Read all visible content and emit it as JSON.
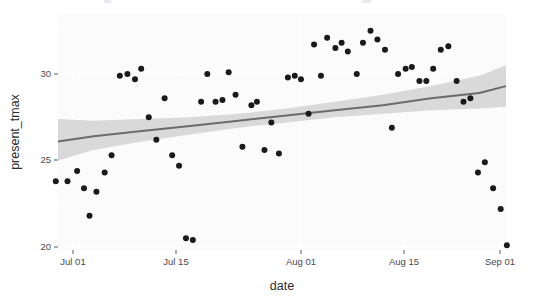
{
  "figure": {
    "background_color": "#ffffff",
    "panel_color": "#fbfbfb",
    "grid_color": "#ffffff",
    "point_color": "#1a1a1a",
    "line_color": "#6b6b6b",
    "ribbon_color": "#d6d6d6"
  },
  "axes": {
    "x_title": "date",
    "y_title": "present_tmax",
    "x_ticks": [
      {
        "label": "Jul 01",
        "px": 73
      },
      {
        "label": "Jul 15",
        "px": 176
      },
      {
        "label": "Aug 01",
        "px": 301
      },
      {
        "label": "Aug 15",
        "px": 404
      },
      {
        "label": "Sep 01",
        "px": 500
      }
    ],
    "y_ticks": [
      {
        "label": "30",
        "value": 30,
        "px": 74
      },
      {
        "label": "25",
        "value": 25,
        "px": 160
      },
      {
        "label": "20",
        "value": 20,
        "px": 247
      }
    ]
  },
  "chart_data": {
    "type": "scatter",
    "title": "",
    "subtitle": "",
    "xlabel": "date",
    "ylabel": "present_tmax",
    "grid": true,
    "legend": false,
    "x_type": "date",
    "x_tick_labels": [
      "Jul 01",
      "Jul 15",
      "Aug 01",
      "Aug 15",
      "Sep 01"
    ],
    "y_tick_labels": [
      "20",
      "25",
      "30"
    ],
    "xlim_days": [
      -4,
      66
    ],
    "ylim": [
      19.3,
      32.8
    ],
    "x_origin_label": "Jul 01",
    "series": [
      {
        "name": "present_tmax observations",
        "marker": "filled-circle",
        "color": "#1a1a1a",
        "points": [
          {
            "day": -2.5,
            "value": 23.8
          },
          {
            "day": -0.8,
            "value": 23.8
          },
          {
            "day": 0.6,
            "value": 24.4
          },
          {
            "day": 1.6,
            "value": 23.4
          },
          {
            "day": 2.4,
            "value": 21.8
          },
          {
            "day": 3.4,
            "value": 23.2
          },
          {
            "day": 4.6,
            "value": 24.3
          },
          {
            "day": 5.6,
            "value": 25.3
          },
          {
            "day": 6.8,
            "value": 29.9
          },
          {
            "day": 7.9,
            "value": 30.0
          },
          {
            "day": 9.0,
            "value": 29.7
          },
          {
            "day": 9.9,
            "value": 30.3
          },
          {
            "day": 11.0,
            "value": 27.5
          },
          {
            "day": 12.1,
            "value": 26.2
          },
          {
            "day": 13.3,
            "value": 28.6
          },
          {
            "day": 14.4,
            "value": 25.3
          },
          {
            "day": 15.4,
            "value": 24.7
          },
          {
            "day": 16.4,
            "value": 20.5
          },
          {
            "day": 17.4,
            "value": 20.4
          },
          {
            "day": 18.6,
            "value": 28.4
          },
          {
            "day": 19.5,
            "value": 30.0
          },
          {
            "day": 20.7,
            "value": 28.4
          },
          {
            "day": 21.7,
            "value": 28.5
          },
          {
            "day": 22.6,
            "value": 30.1
          },
          {
            "day": 23.6,
            "value": 28.8
          },
          {
            "day": 24.6,
            "value": 25.8
          },
          {
            "day": 25.9,
            "value": 28.2
          },
          {
            "day": 26.7,
            "value": 28.4
          },
          {
            "day": 27.8,
            "value": 25.6
          },
          {
            "day": 28.8,
            "value": 27.2
          },
          {
            "day": 29.9,
            "value": 25.4
          },
          {
            "day": 31.2,
            "value": 29.8
          },
          {
            "day": 32.2,
            "value": 29.9
          },
          {
            "day": 33.1,
            "value": 29.7
          },
          {
            "day": 34.2,
            "value": 27.7
          },
          {
            "day": 35.0,
            "value": 31.7
          },
          {
            "day": 36.0,
            "value": 29.9
          },
          {
            "day": 36.9,
            "value": 32.1
          },
          {
            "day": 38.1,
            "value": 31.5
          },
          {
            "day": 39.0,
            "value": 31.8
          },
          {
            "day": 39.9,
            "value": 31.3
          },
          {
            "day": 41.2,
            "value": 30.0
          },
          {
            "day": 42.1,
            "value": 31.8
          },
          {
            "day": 43.2,
            "value": 32.5
          },
          {
            "day": 44.2,
            "value": 32.0
          },
          {
            "day": 45.3,
            "value": 31.4
          },
          {
            "day": 46.3,
            "value": 26.9
          },
          {
            "day": 47.2,
            "value": 30.0
          },
          {
            "day": 48.3,
            "value": 30.3
          },
          {
            "day": 49.2,
            "value": 30.4
          },
          {
            "day": 50.3,
            "value": 29.6
          },
          {
            "day": 51.3,
            "value": 29.6
          },
          {
            "day": 52.3,
            "value": 30.3
          },
          {
            "day": 53.4,
            "value": 31.4
          },
          {
            "day": 54.5,
            "value": 31.6
          },
          {
            "day": 55.7,
            "value": 29.6
          },
          {
            "day": 56.7,
            "value": 28.4
          },
          {
            "day": 57.7,
            "value": 28.6
          },
          {
            "day": 58.8,
            "value": 24.3
          },
          {
            "day": 59.8,
            "value": 24.9
          },
          {
            "day": 61.0,
            "value": 23.4
          },
          {
            "day": 62.1,
            "value": 22.2
          },
          {
            "day": 63.0,
            "value": 20.1
          }
        ]
      }
    ],
    "fit": {
      "name": "loess smooth",
      "line_color": "#6b6b6b",
      "ribbon_color": "#d6d6d6",
      "ribbon_label": "95% confidence band",
      "nodes": [
        {
          "day": -4.0,
          "fit": 26.1,
          "lo": 25.0,
          "hi": 27.4
        },
        {
          "day": 3.0,
          "fit": 26.4,
          "lo": 25.6,
          "hi": 27.3
        },
        {
          "day": 10.0,
          "fit": 26.7,
          "lo": 26.1,
          "hi": 27.4
        },
        {
          "day": 17.0,
          "fit": 27.0,
          "lo": 26.5,
          "hi": 27.5
        },
        {
          "day": 24.0,
          "fit": 27.3,
          "lo": 26.9,
          "hi": 27.7
        },
        {
          "day": 31.0,
          "fit": 27.6,
          "lo": 27.2,
          "hi": 28.0
        },
        {
          "day": 38.0,
          "fit": 27.9,
          "lo": 27.5,
          "hi": 28.4
        },
        {
          "day": 45.0,
          "fit": 28.2,
          "lo": 27.7,
          "hi": 28.8
        },
        {
          "day": 52.0,
          "fit": 28.6,
          "lo": 27.9,
          "hi": 29.3
        },
        {
          "day": 59.0,
          "fit": 28.9,
          "lo": 28.0,
          "hi": 29.9
        },
        {
          "day": 66.0,
          "fit": 29.3,
          "lo": 28.1,
          "hi": 30.5
        }
      ]
    }
  },
  "top_fragment": {
    "note": "cropped text sliver at top edge",
    "visible": true
  }
}
